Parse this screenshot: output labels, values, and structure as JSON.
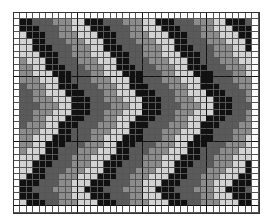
{
  "chart_data": {
    "type": "heatmap",
    "cols": 38,
    "rows": 31,
    "cell_px": 6.45,
    "major_line_every": 10,
    "border_cells_white": true,
    "shades": [
      "#111111",
      "#5a5a5a",
      "#8c8c8c",
      "#d2d2d2"
    ],
    "background": "#ffffff",
    "pattern": {
      "kind": "chevron",
      "direction": "right",
      "band_width_cols": 3,
      "horizontal_period_cols": 11,
      "vertical_period_rows": 26,
      "vertex_amplitude_cols": 9
    }
  }
}
